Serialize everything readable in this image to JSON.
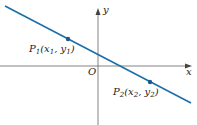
{
  "diagram": {
    "type": "coordinate-plane-line",
    "axes": {
      "x_label": "x",
      "y_label": "y",
      "origin_label": "O",
      "axis_color": "#555555"
    },
    "line": {
      "color": "#1a6fa8",
      "start": [
        5,
        6
      ],
      "end": [
        191,
        103
      ]
    },
    "points": [
      {
        "name": "P",
        "sub": "1",
        "label_x": "x",
        "label_x_sub": "1",
        "label_y": "y",
        "label_y_sub": "1",
        "px": [
          68,
          39
        ],
        "color": "#1a5a8a"
      },
      {
        "name": "P",
        "sub": "2",
        "label_x": "x",
        "label_x_sub": "2",
        "label_y": "y",
        "label_y_sub": "2",
        "px": [
          150,
          82
        ],
        "color": "#1a5a8a"
      }
    ],
    "point_labels": [
      "P1(x1, y1)",
      "P2(x2, y2)"
    ]
  }
}
